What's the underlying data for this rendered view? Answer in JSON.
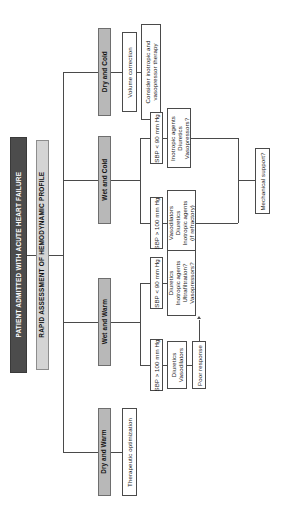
{
  "diagram": {
    "type": "flowchart",
    "orientation": "rotated-90-counterclockwise",
    "colors": {
      "root_fill": "#4c4c4c",
      "root_text": "#ffffff",
      "assessment_fill": "#d4d4d4",
      "profile_fill": "#b8b8b8",
      "box_fill": "#ffffff",
      "line": "#4a4a4a",
      "background": "#ffffff"
    },
    "root": {
      "label": "PATIENT ADMITTED WITH ACUTE HEART FAILURE"
    },
    "assessment": {
      "label": "RAPID ASSESSMENT OF HEMODYNAMIC PROFILE"
    },
    "profiles": [
      {
        "id": "dry-cold",
        "label": "Dry and Cold"
      },
      {
        "id": "wet-cold",
        "label": "Wet and Cold"
      },
      {
        "id": "wet-warm",
        "label": "Wet and Warm"
      },
      {
        "id": "dry-warm",
        "label": "Dry and Warm"
      }
    ],
    "nodes": {
      "dry_cold_volume": {
        "label": "Volume correction"
      },
      "dry_cold_inotropic": {
        "label": "Consider inotropic and\nvasopressor therapy"
      },
      "wet_cold_sbp_low": {
        "label": "SBP < 90 mm Hg"
      },
      "wet_cold_sbp_low_tx": {
        "label": "Inotropic agents\nDiuretics\nVasopressors?"
      },
      "wet_cold_sbp_high": {
        "label": "SBP > 100 mm Hg"
      },
      "wet_cold_sbp_high_tx": {
        "label": "Vasodilators\nDiuretics\nInotropic agents\n(if refractory)"
      },
      "mechanical_support": {
        "label": "Mechanical support?"
      },
      "wet_warm_sbp_low": {
        "label": "SBP < 90 mm Hg"
      },
      "wet_warm_sbp_low_tx": {
        "label": "Diuretics\nInotropic agents\nUltrafiltration?\nVasopressors?"
      },
      "wet_warm_sbp_high": {
        "label": "SBP > 100 mm Hg"
      },
      "wet_warm_sbp_high_tx": {
        "label": "Diuretics\nVasodilators"
      },
      "poor_response": {
        "label": "Poor response"
      },
      "dry_warm_tx": {
        "label": "Therapeutic optimization"
      }
    }
  }
}
